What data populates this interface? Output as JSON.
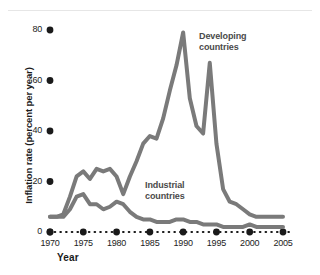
{
  "chart_data": {
    "type": "line",
    "title": "",
    "subtitle": "",
    "xlabel": "Year",
    "ylabel": "Inflation rate (percent per year)",
    "xlim": [
      1970,
      2005
    ],
    "ylim": [
      0,
      80
    ],
    "xticks": [
      1970,
      1975,
      1980,
      1985,
      1990,
      1995,
      2000,
      2005
    ],
    "xtick_labels": [
      "1970",
      "1975",
      "1980",
      "1985",
      "1990",
      "1995",
      "2000",
      "2005"
    ],
    "yticks": [
      0,
      20,
      40,
      60,
      80
    ],
    "ytick_labels": [
      "0",
      "20",
      "40",
      "60",
      "80"
    ],
    "grid": false,
    "legend_position": "inline-annotation",
    "line_color": "#7a7a7a",
    "axis_dot_color": "#1a1a1a",
    "annotations": [
      {
        "text_line1": "Developing",
        "text_line2": "countries",
        "series": "Developing countries"
      },
      {
        "text_line1": "Industrial",
        "text_line2": "countries",
        "series": "Industrial countries"
      }
    ],
    "series": [
      {
        "name": "Developing countries",
        "color": "#7a7a7a",
        "x": [
          1970,
          1971,
          1972,
          1973,
          1974,
          1975,
          1976,
          1977,
          1978,
          1979,
          1980,
          1981,
          1982,
          1983,
          1984,
          1985,
          1986,
          1987,
          1988,
          1989,
          1990,
          1991,
          1992,
          1993,
          1994,
          1995,
          1996,
          1997,
          1998,
          1999,
          2000,
          2001,
          2002,
          2003,
          2004,
          2005
        ],
        "values": [
          6,
          6,
          7,
          14,
          22,
          24,
          21,
          25,
          24,
          25,
          22,
          15,
          22,
          28,
          35,
          38,
          37,
          45,
          56,
          66,
          79,
          53,
          42,
          39,
          67,
          35,
          17,
          12,
          11,
          9,
          7,
          6,
          6,
          6,
          6,
          6
        ]
      },
      {
        "name": "Industrial countries",
        "color": "#7a7a7a",
        "x": [
          1970,
          1971,
          1972,
          1973,
          1974,
          1975,
          1976,
          1977,
          1978,
          1979,
          1980,
          1981,
          1982,
          1983,
          1984,
          1985,
          1986,
          1987,
          1988,
          1989,
          1990,
          1991,
          1992,
          1993,
          1994,
          1995,
          1996,
          1997,
          1998,
          1999,
          2000,
          2001,
          2002,
          2003,
          2004,
          2005
        ],
        "values": [
          6,
          6,
          6,
          9,
          14,
          15,
          11,
          11,
          9,
          10,
          12,
          11,
          8,
          6,
          5,
          5,
          4,
          4,
          4,
          5,
          5,
          4,
          4,
          3,
          3,
          3,
          2,
          2,
          2,
          2,
          3,
          2,
          2,
          2,
          2,
          2
        ]
      }
    ]
  }
}
